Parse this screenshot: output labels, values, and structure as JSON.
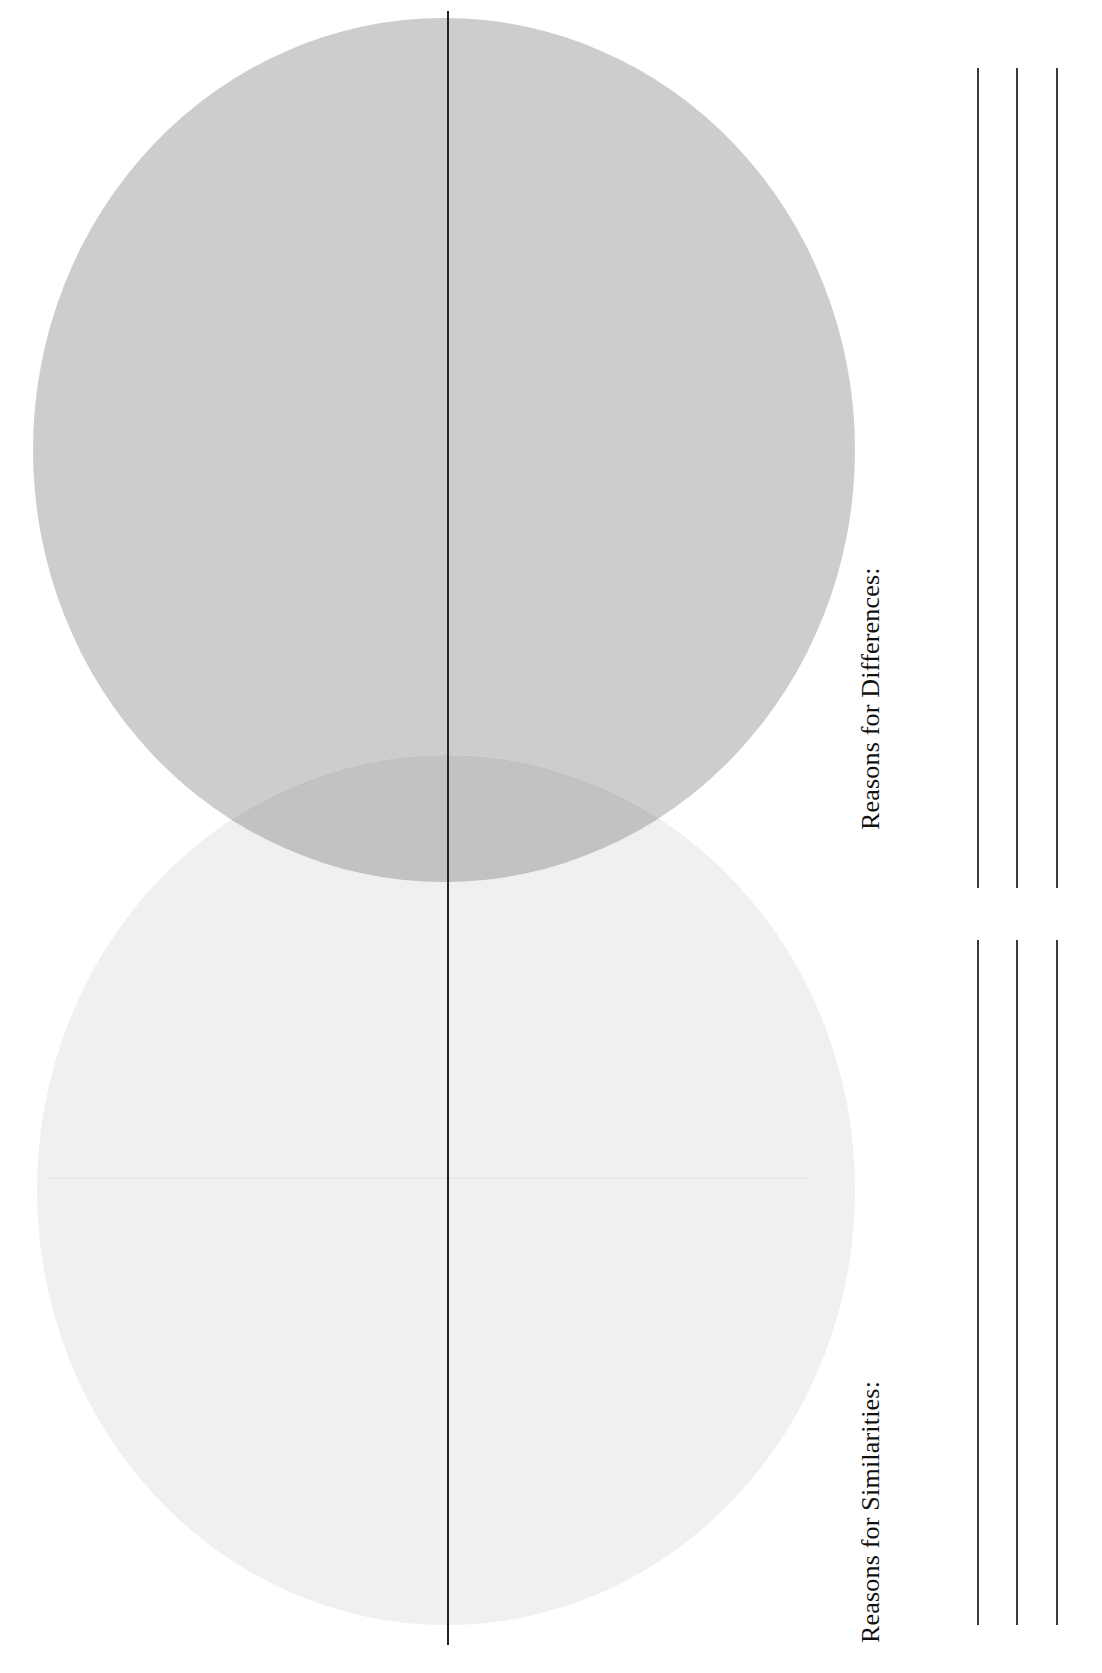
{
  "worksheet": {
    "orientation": "rotated-90",
    "background_color": "#ffffff"
  },
  "venn": {
    "name": "venn-diagram",
    "divider_color": "#232323",
    "circles": [
      {
        "id": "top-circle",
        "label": "",
        "fill": "#cdcdcd",
        "cx": 444,
        "cy": 450,
        "rx": 411,
        "ry": 432
      },
      {
        "id": "bottom-circle",
        "label": "",
        "fill": "#f0f0f0",
        "cx": 446,
        "cy": 1190,
        "rx": 409,
        "ry": 435
      }
    ],
    "overlap_fill": "#c2c2c2"
  },
  "sections": [
    {
      "id": "differences",
      "label": "Reasons for Differences:",
      "line_count": 3
    },
    {
      "id": "similarities",
      "label": "Reasons for Similarities:",
      "line_count": 3
    }
  ]
}
